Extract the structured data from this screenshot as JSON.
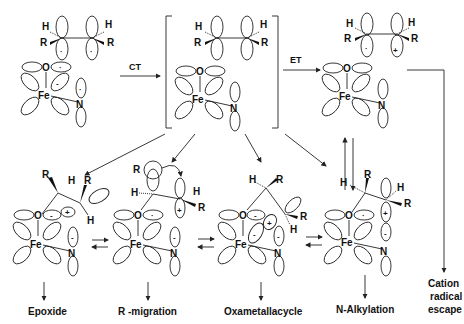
{
  "arrows": {
    "ct": "CT",
    "et": "ET"
  },
  "atoms": {
    "H": "H",
    "R": "R",
    "O": "O",
    "Fe": "Fe",
    "N": "N"
  },
  "charges": {
    "radical": "·",
    "plus": "+",
    "minus": "-"
  },
  "products": {
    "epoxide": "Epoxide",
    "r_migration": "R -migration",
    "oxametallacycle": "Oxametallacycle",
    "n_alkylation": "N-Alkylation",
    "cation_radical_line1": "Cation",
    "cation_radical_line2": "radical",
    "cation_radical_line3": "escape"
  },
  "colors": {
    "ink": "#222222",
    "background": "#ffffff"
  }
}
